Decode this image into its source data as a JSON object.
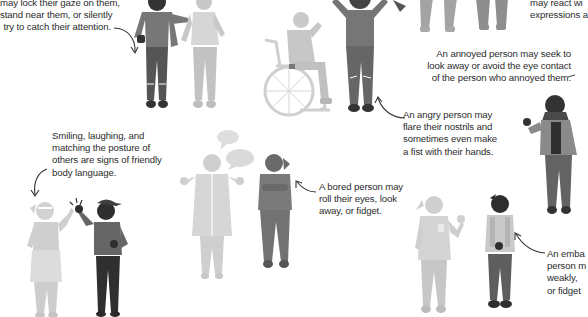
{
  "captions": {
    "attraction": {
      "lines": [
        "may lock their gaze on them,",
        "stand near them, or silently",
        "try to catch their attention."
      ]
    },
    "surprised": {
      "lines": [
        "may react wi",
        "expressions a"
      ]
    },
    "annoyed": {
      "lines": [
        "An annoyed person may seek to",
        "look away or avoid the eye contact",
        "of the person who annoyed them."
      ]
    },
    "angry": {
      "lines": [
        "An angry person may",
        "flare their nostrils and",
        "sometimes even make",
        "a fist with their hands."
      ]
    },
    "friendly": {
      "lines": [
        "Smiling, laughing, and",
        "matching the posture of",
        "others are signs of friendly",
        "body language."
      ]
    },
    "bored": {
      "lines": [
        "A bored person may",
        "roll their eyes, look",
        "away, or fidget."
      ]
    },
    "embarrassed": {
      "lines": [
        "An emba",
        "person m",
        "weakly,",
        "or fidget"
      ]
    }
  },
  "colors": {
    "dark": "#3a3a3a",
    "mid": "#6e6e6e",
    "light": "#a8a8a8",
    "pale": "#cfcfcf",
    "text": "#2b2b2b"
  },
  "figures": [
    {
      "name": "admiring-man",
      "shade": "mid"
    },
    {
      "name": "admired-woman",
      "shade": "pale"
    },
    {
      "name": "wheelchair-user",
      "shade": "pale"
    },
    {
      "name": "angry-man",
      "shade": "mid"
    },
    {
      "name": "annoyed-woman-hijab",
      "shade": "mid"
    },
    {
      "name": "high-five-girl",
      "shade": "pale"
    },
    {
      "name": "high-five-boy-cap",
      "shade": "dark"
    },
    {
      "name": "talking-man",
      "shade": "pale"
    },
    {
      "name": "bored-girl",
      "shade": "mid"
    },
    {
      "name": "waving-woman",
      "shade": "pale"
    },
    {
      "name": "embarrassed-boy",
      "shade": "mid"
    }
  ]
}
